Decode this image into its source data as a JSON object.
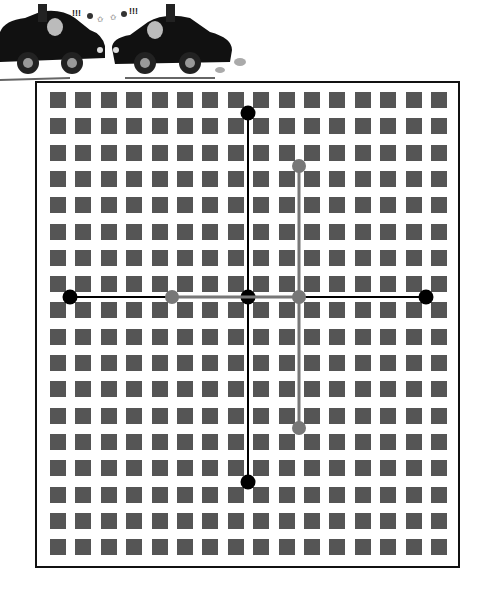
{
  "illustration": {
    "description": "Two cartoon cars facing each other with angry drivers",
    "symbols": [
      "!!!",
      "!!!"
    ]
  },
  "grid": {
    "columns": 16,
    "rows": 18,
    "square_color": "#555555",
    "origin_x": 50,
    "origin_y": 92,
    "pitch_x": 25.4,
    "pitch_y": 26.3,
    "square_size": 16
  },
  "cross_black": {
    "color": "#000000",
    "horizontal": {
      "y": 297,
      "x1": 70,
      "x2": 426
    },
    "vertical": {
      "x": 248,
      "y1": 113,
      "y2": 482
    },
    "dots": [
      {
        "x": 248,
        "y": 113
      },
      {
        "x": 70,
        "y": 297
      },
      {
        "x": 248,
        "y": 297
      },
      {
        "x": 426,
        "y": 297
      },
      {
        "x": 248,
        "y": 482
      }
    ]
  },
  "cross_gray": {
    "color": "#777777",
    "horizontal": {
      "y": 297,
      "x1": 172,
      "x2": 299
    },
    "vertical": {
      "x": 299,
      "y1": 166,
      "y2": 428
    },
    "dots": [
      {
        "x": 299,
        "y": 166
      },
      {
        "x": 172,
        "y": 297
      },
      {
        "x": 299,
        "y": 297
      },
      {
        "x": 299,
        "y": 428
      }
    ]
  }
}
